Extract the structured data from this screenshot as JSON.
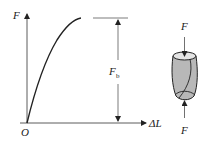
{
  "diagram": {
    "axes": {
      "y_label": "F",
      "x_label": "ΔL",
      "origin_label": "O"
    },
    "dimension": {
      "label_main": "F",
      "label_sub": "b"
    },
    "specimen": {
      "top_force_label": "F",
      "bottom_force_label": "F"
    },
    "colors": {
      "line": "#222222",
      "specimen_fill": "#b8b8b8",
      "background": "#ffffff"
    }
  }
}
